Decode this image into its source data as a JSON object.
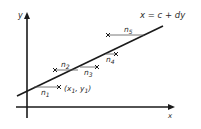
{
  "diagram": {
    "axes": {
      "x_label": "x",
      "y_label": "y"
    },
    "equation": "x = c + dy",
    "point_label": {
      "open": "(x",
      "sub1": "1",
      "comma": ", y",
      "sub2": "1",
      "close": ")"
    },
    "residuals": [
      {
        "label": "n",
        "sub": "1"
      },
      {
        "label": "n",
        "sub": "2"
      },
      {
        "label": "n",
        "sub": "3"
      },
      {
        "label": "n",
        "sub": "4"
      },
      {
        "label": "n",
        "sub": "5"
      }
    ],
    "colors": {
      "line": "#1a1a1a",
      "residual": "#555555",
      "text": "#2a2a2a",
      "background": "#ffffff"
    }
  }
}
